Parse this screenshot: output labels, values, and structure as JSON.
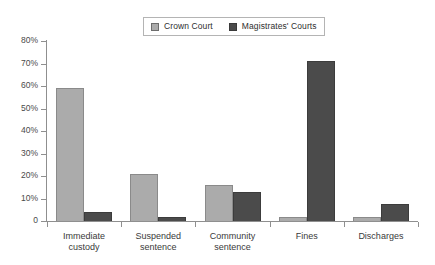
{
  "chart_data": {
    "type": "bar",
    "title": "",
    "xlabel": "",
    "ylabel": "",
    "categories": [
      "Immediate\ncustody",
      "Suspended\nsentence",
      "Community\nsentence",
      "Fines",
      "Discharges"
    ],
    "series": [
      {
        "name": "Crown Court",
        "color": "#ababab",
        "values": [
          59,
          21,
          16,
          2,
          2
        ]
      },
      {
        "name": "Magistrates' Courts",
        "color": "#4b4b4b",
        "values": [
          4,
          2,
          13,
          71,
          7.5
        ]
      }
    ],
    "ylim": [
      0,
      80
    ],
    "ytick_values": [
      0,
      10,
      20,
      30,
      40,
      50,
      60,
      70,
      80
    ],
    "ytick_labels": [
      "0",
      "10%",
      "20%",
      "30%",
      "40%",
      "50%",
      "60%",
      "70%",
      "80%"
    ],
    "grid": false,
    "legend_position": "top-center"
  },
  "legend": {
    "entries": [
      {
        "label": "Crown Court"
      },
      {
        "label": "Magistrates' Courts"
      }
    ]
  }
}
